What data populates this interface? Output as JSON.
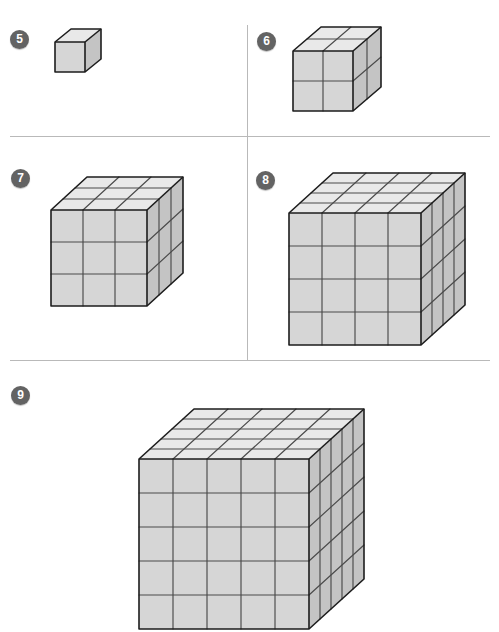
{
  "page": {
    "background_color": "#ffffff",
    "width": 499,
    "height": 564
  },
  "divider_color": "#b9b9b9",
  "dividers": [
    {
      "name": "divider-horizontal-upper",
      "orientation": "horizontal",
      "x": 10,
      "y": 136,
      "length": 480
    },
    {
      "name": "divider-horizontal-lower",
      "orientation": "horizontal",
      "x": 10,
      "y": 360,
      "length": 480
    },
    {
      "name": "divider-vertical-middle",
      "orientation": "vertical",
      "x": 247,
      "y": 25,
      "length": 335
    }
  ],
  "colors": {
    "badge_fill": "#636363",
    "badge_text": "#ffffff",
    "cube_front": "#d6d6d6",
    "cube_top": "#e9e9e9",
    "cube_side": "#c4c4c4",
    "edge_outer": "#1d1d1d",
    "edge_inner": "#4a4a4a"
  },
  "problems": [
    {
      "number": "5",
      "badge_x": 10,
      "badge_y": 30,
      "figure_x": 52,
      "figure_y": 26,
      "cube": {
        "n": 1,
        "cell": 30,
        "dx": 16,
        "dy": -13,
        "total_units": 1
      }
    },
    {
      "number": "6",
      "badge_x": 257,
      "badge_y": 32,
      "figure_x": 290,
      "figure_y": 24,
      "cube": {
        "n": 2,
        "cell": 30,
        "dx": 14,
        "dy": -12,
        "total_units": 8
      }
    },
    {
      "number": "7",
      "badge_x": 11,
      "badge_y": 169,
      "figure_x": 48,
      "figure_y": 174,
      "cube": {
        "n": 3,
        "cell": 32,
        "dx": 12,
        "dy": -11,
        "total_units": 27
      }
    },
    {
      "number": "8",
      "badge_x": 256,
      "badge_y": 171,
      "figure_x": 286,
      "figure_y": 170,
      "cube": {
        "n": 4,
        "cell": 33,
        "dx": 11,
        "dy": -10,
        "total_units": 64
      }
    },
    {
      "number": "9",
      "badge_x": 11,
      "badge_y": 386,
      "figure_x": 136,
      "figure_y": 406,
      "cube": {
        "n": 5,
        "cell": 34,
        "dx": 11,
        "dy": -10,
        "total_units": 125
      }
    }
  ]
}
